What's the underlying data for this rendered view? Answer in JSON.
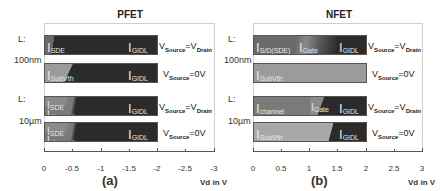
{
  "colors": {
    "dark": "#2b2b2b",
    "mid": "#6a6a6a",
    "light": "#9b9b9b",
    "lighter": "#a8a8a8",
    "frame": "#cfcfcf"
  },
  "row_labels": {
    "l": "L:",
    "l_short": "100nm",
    "l_long": "10µm"
  },
  "conditions": {
    "equal_prefix": "V",
    "equal_sub1": "Source",
    "equal_mid": "=V",
    "equal_sub2": "Drain",
    "zero_prefix": "V",
    "zero_sub": "Source",
    "zero_suffix": "=0V"
  },
  "panels": [
    {
      "title": "PFET",
      "sublabel": "(a)",
      "axis_title": "Vd in V",
      "ticks": [
        "0",
        "-0.5",
        "-1",
        "-1.5",
        "-2",
        "-2.5",
        "-3"
      ],
      "bars": [
        {
          "row": "100nm / VSource=VDrain",
          "labels": [
            "I",
            "SDE",
            "I",
            "GIDL"
          ]
        },
        {
          "row": "100nm / VSource=0V",
          "labels": [
            "I",
            "SubVth",
            "I",
            "GIDL"
          ]
        },
        {
          "row": "10µm / VSource=VDrain",
          "labels": [
            "I",
            "SDE",
            "I",
            "channel",
            "I",
            "GIDL"
          ]
        },
        {
          "row": "10µm / VSource=0V",
          "labels": [
            "I",
            "SDE",
            "I",
            "channel",
            "I",
            "GIDL"
          ]
        }
      ]
    },
    {
      "title": "NFET",
      "sublabel": "(b)",
      "axis_title": "Vd in V",
      "ticks": [
        "0",
        "0.5",
        "1",
        "1.5",
        "2",
        "2.5",
        "3"
      ],
      "bars": [
        {
          "row": "100nm / VSource=VDrain",
          "labels": [
            "I",
            "S/D(SDE)",
            "I",
            "Gate",
            "I",
            "GIDL"
          ]
        },
        {
          "row": "100nm / VSource=0V",
          "labels": [
            "I",
            "SubVth"
          ]
        },
        {
          "row": "10µm / VSource=VDrain",
          "labels": [
            "I",
            "channel",
            "I",
            "Gate",
            "I",
            "GIDL"
          ]
        },
        {
          "row": "10µm / VSource=0V",
          "labels": [
            "I",
            "SubVth",
            "I",
            "GIDL"
          ]
        }
      ]
    }
  ]
}
